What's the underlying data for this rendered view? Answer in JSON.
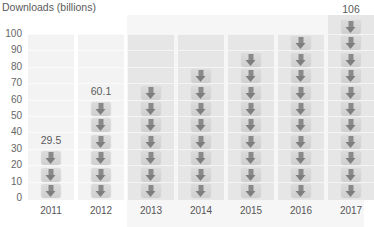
{
  "chart_data": {
    "type": "bar",
    "title": "",
    "ylabel": "Downloads (billions)",
    "xlabel": "",
    "categories": [
      "2011",
      "2012",
      "2013",
      "2014",
      "2015",
      "2016",
      "2017"
    ],
    "values": [
      29.5,
      60.1,
      70,
      79,
      88,
      98,
      106
    ],
    "data_labels": [
      "29.5",
      "60.1",
      "",
      "",
      "",
      "",
      "106"
    ],
    "icon_counts": [
      3,
      6,
      7,
      8,
      9,
      10,
      11
    ],
    "yticks": [
      "0",
      "10",
      "20",
      "30",
      "40",
      "50",
      "60",
      "70",
      "80",
      "90",
      "100"
    ],
    "ylim": [
      0,
      106
    ],
    "grid": true,
    "legend": "none",
    "bar_style": "pictograph of stacked download-arrow icons",
    "highlighted_range": [
      "2013",
      "2017"
    ]
  },
  "colors": {
    "text": "#5a5a5a",
    "column_light": "#f3f3f3",
    "column_dark": "#e6e6e6",
    "panel": "#f6f6f6",
    "icon_arrow": "#808080"
  }
}
